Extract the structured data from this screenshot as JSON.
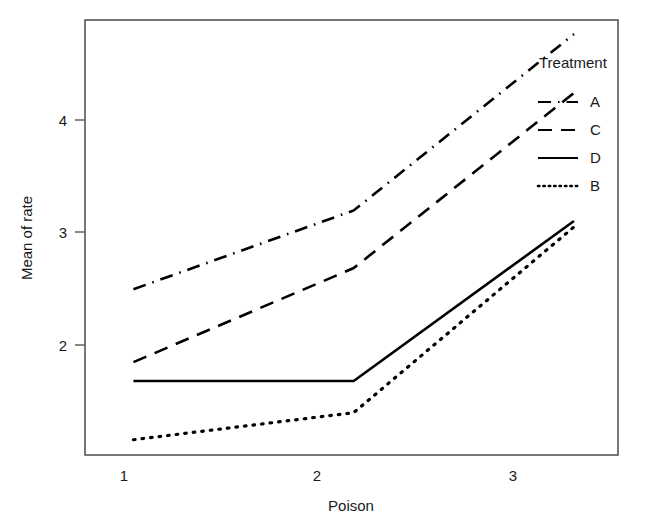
{
  "chart_data": {
    "type": "line",
    "title": "",
    "xlabel": "Poison",
    "ylabel": "Mean of rate",
    "categories": [
      "1",
      "2",
      "3"
    ],
    "x": [
      1,
      2,
      3
    ],
    "xlim": [
      0.78,
      3.2
    ],
    "ylim": [
      1.1,
      4.8
    ],
    "xticks": [
      "1",
      "2",
      "3"
    ],
    "yticks": [
      "2",
      "3",
      "4"
    ],
    "ytick_values": [
      2,
      3,
      4
    ],
    "grid": false,
    "legend_position": "upper right",
    "legend_title": "Treatment",
    "series": [
      {
        "name": "A",
        "values": [
          2.51,
          3.18,
          4.68
        ],
        "linestyle": "dashdot",
        "color": "#000000"
      },
      {
        "name": "C",
        "values": [
          1.89,
          2.69,
          4.18
        ],
        "linestyle": "dashed",
        "color": "#000000"
      },
      {
        "name": "D",
        "values": [
          1.73,
          1.73,
          3.09
        ],
        "linestyle": "solid",
        "color": "#000000"
      },
      {
        "name": "B",
        "values": [
          1.23,
          1.46,
          3.04
        ],
        "linestyle": "dotted",
        "color": "#000000"
      }
    ]
  },
  "axes": {
    "x_title": "Poison",
    "y_title": "Mean of rate",
    "x_tick_labels": [
      "1",
      "2",
      "3"
    ],
    "y_tick_labels": [
      "2",
      "3",
      "4"
    ]
  },
  "legend": {
    "title": "Treatment",
    "entries": [
      {
        "label": "A",
        "style": "dashdot"
      },
      {
        "label": "C",
        "style": "dashed"
      },
      {
        "label": "D",
        "style": "solid"
      },
      {
        "label": "B",
        "style": "dotted"
      }
    ]
  },
  "colors": {
    "line": "#000000",
    "frame": "#555555",
    "text": "#1a1a1a",
    "background": "#ffffff"
  }
}
